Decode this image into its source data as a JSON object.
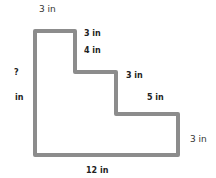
{
  "diagram": {
    "type": "rectilinear-staircase-shape",
    "stroke_color": "#8c8c8c",
    "labels": {
      "top_width": "3 in",
      "step1_drop": "3 in",
      "step1_drop_b": "4 in",
      "step2_width": "3 in",
      "step2_drop": "5 in",
      "right_height": "3 in",
      "bottom_width": "12 in",
      "left_height_q": "?",
      "left_height_unit": "in"
    }
  }
}
